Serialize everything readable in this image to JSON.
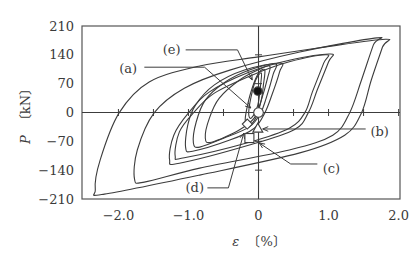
{
  "chart_data": {
    "type": "line",
    "title": "",
    "xlabel": "ε 〔%〕",
    "ylabel": "P 〔kN〕",
    "xlabel_parts": {
      "var": "ε",
      "unit": "〔%〕"
    },
    "ylabel_parts": {
      "var": "P",
      "unit": "〔kN〕"
    },
    "xlim": [
      -2.52,
      2.02
    ],
    "ylim": [
      -210,
      210
    ],
    "xticks": [
      -2.0,
      -1.0,
      0,
      1.0,
      2.0
    ],
    "xtick_labels": [
      "−2.0",
      "−1.0",
      "0",
      "1.0",
      "2.0"
    ],
    "yticks": [
      210,
      140,
      70,
      0,
      -70,
      -140,
      -210
    ],
    "ytick_labels": [
      "210",
      "140",
      "70",
      "0",
      "−70",
      "−140",
      "−210"
    ],
    "minor_xticks_on_zero_line": [
      -2.0,
      -1.5,
      -1.0,
      -0.5,
      0.5,
      1.0,
      1.5,
      2.0
    ],
    "minor_yticks_on_zero_line": [
      140,
      70,
      -70,
      -140
    ],
    "grid": false,
    "legend": null,
    "series": [
      {
        "name": "loop-1",
        "points": [
          [
            1.81,
            178
          ],
          [
            1.77,
            159
          ],
          [
            1.61,
            79
          ],
          [
            1.47,
            -1
          ],
          [
            1.23,
            -55
          ],
          [
            0.59,
            -98
          ],
          [
            -0.84,
            -152
          ],
          [
            -2.2,
            -198
          ],
          [
            -2.33,
            -188
          ],
          [
            -2.26,
            -115
          ],
          [
            -1.99,
            -1
          ],
          [
            -1.56,
            74
          ],
          [
            -0.84,
            113
          ],
          [
            0,
            135
          ],
          [
            0.87,
            157
          ]
        ]
      },
      {
        "name": "loop-2",
        "points": [
          [
            1.69,
            181
          ],
          [
            1.64,
            164
          ],
          [
            1.47,
            79
          ],
          [
            1.3,
            -1
          ],
          [
            1.06,
            -55
          ],
          [
            0.44,
            -91
          ],
          [
            -0.84,
            -135
          ],
          [
            -1.63,
            -169
          ],
          [
            -1.77,
            -161
          ],
          [
            -1.73,
            -91
          ],
          [
            -1.49,
            -1
          ],
          [
            -1.06,
            59
          ],
          [
            -0.41,
            103
          ],
          [
            0.59,
            147
          ]
        ]
      },
      {
        "name": "loop-3",
        "points": [
          [
            1.03,
            142
          ],
          [
            1.0,
            123
          ],
          [
            0.84,
            55
          ],
          [
            0.71,
            -1
          ],
          [
            0.51,
            -42
          ],
          [
            -0.13,
            -79
          ],
          [
            -1.13,
            -123
          ],
          [
            -1.27,
            -115
          ],
          [
            -1.21,
            -55
          ],
          [
            -1.0,
            -1
          ],
          [
            -0.7,
            50
          ],
          [
            -0.13,
            98
          ],
          [
            0.44,
            127
          ]
        ]
      },
      {
        "name": "loop-4",
        "points": [
          [
            0.97,
            140
          ],
          [
            0.93,
            120
          ],
          [
            0.77,
            50
          ],
          [
            0.66,
            -1
          ],
          [
            0.44,
            -38
          ],
          [
            -0.13,
            -72
          ],
          [
            -1.06,
            -110
          ],
          [
            -1.19,
            -106
          ],
          [
            -1.13,
            -47
          ],
          [
            -0.93,
            -1
          ],
          [
            -0.63,
            47
          ],
          [
            -0.06,
            93
          ],
          [
            0.44,
            123
          ]
        ]
      },
      {
        "name": "loop-5",
        "points": [
          [
            0.31,
            120
          ],
          [
            0.3,
            98
          ],
          [
            0.19,
            42
          ],
          [
            0.09,
            -1
          ],
          [
            -0.06,
            -38
          ],
          [
            -0.41,
            -67
          ],
          [
            -0.94,
            -94
          ],
          [
            -1.04,
            -86
          ],
          [
            -1.01,
            -30
          ],
          [
            -0.9,
            18
          ],
          [
            -0.63,
            67
          ],
          [
            -0.2,
            103
          ]
        ]
      },
      {
        "name": "loop-6",
        "points": [
          [
            0.24,
            118
          ],
          [
            0.21,
            93
          ],
          [
            0.11,
            35
          ],
          [
            0.03,
            -1
          ],
          [
            -0.13,
            -35
          ],
          [
            -0.49,
            -62
          ],
          [
            -0.84,
            -84
          ],
          [
            -0.93,
            -74
          ],
          [
            -0.89,
            -23
          ],
          [
            -0.76,
            30
          ],
          [
            -0.49,
            72
          ],
          [
            -0.13,
            103
          ]
        ]
      },
      {
        "name": "loop-7",
        "points": [
          [
            0.16,
            113
          ],
          [
            0.13,
            84
          ],
          [
            0.04,
            30
          ],
          [
            -0.06,
            -13
          ],
          [
            -0.27,
            -42
          ],
          [
            -0.67,
            -72
          ],
          [
            -0.76,
            -62
          ],
          [
            -0.7,
            -13
          ],
          [
            -0.56,
            35
          ],
          [
            -0.27,
            79
          ],
          [
            -0.01,
            103
          ]
        ]
      },
      {
        "name": "loop-8",
        "points": [
          [
            0.09,
            103
          ],
          [
            0.07,
            67
          ],
          [
            0.04,
            30
          ],
          [
            -0.04,
            -13
          ],
          [
            -0.13,
            -30
          ],
          [
            -0.19,
            -18
          ],
          [
            -0.14,
            30
          ],
          [
            -0.06,
            74
          ],
          [
            0.01,
            98
          ]
        ]
      },
      {
        "name": "loop-9",
        "points": [
          [
            0.04,
            96
          ],
          [
            0.03,
            67
          ],
          [
            -0.01,
            18
          ],
          [
            -0.1,
            -13
          ],
          [
            -0.14,
            -4
          ],
          [
            -0.11,
            35
          ],
          [
            -0.04,
            79
          ]
        ]
      }
    ],
    "markers": [
      {
        "id": "e",
        "shape": "filled-circle",
        "x": -0.01,
        "y": 52
      },
      {
        "id": "a",
        "shape": "open-circle",
        "x": 0.0,
        "y": 0
      },
      {
        "id": "d",
        "shape": "open-diamond",
        "x": -0.16,
        "y": -28
      },
      {
        "id": "b",
        "shape": "open-triangle",
        "x": -0.01,
        "y": -38
      },
      {
        "id": "c",
        "shape": "open-square",
        "x": -0.13,
        "y": -62
      }
    ],
    "annotations": [
      {
        "text": "(e)",
        "label_at": [
          -1.24,
          152
        ],
        "line": [
          [
            -1.04,
            152
          ],
          [
            -0.3,
            152
          ],
          [
            -0.09,
            79
          ]
        ]
      },
      {
        "text": "(a)",
        "label_at": [
          -1.86,
          106
        ],
        "line": [
          [
            -1.63,
            110
          ],
          [
            -0.77,
            110
          ],
          [
            -0.11,
            11
          ]
        ]
      },
      {
        "text": "(b)",
        "label_at": [
          1.73,
          -45
        ],
        "line": [
          [
            1.53,
            -40
          ],
          [
            0.06,
            -40
          ]
        ]
      },
      {
        "text": "(c)",
        "label_at": [
          1.04,
          -135
        ],
        "line": [
          [
            0.84,
            -125
          ],
          [
            0.46,
            -125
          ],
          [
            0.01,
            -74
          ]
        ]
      },
      {
        "text": "(d)",
        "label_at": [
          -0.91,
          -183
        ],
        "line": [
          [
            -0.73,
            -183
          ],
          [
            -0.43,
            -183
          ],
          [
            -0.21,
            -50
          ]
        ]
      }
    ],
    "colors": {
      "line": "#3c3c3c",
      "text": "#3a3a3a",
      "background": "#ffffff"
    }
  }
}
